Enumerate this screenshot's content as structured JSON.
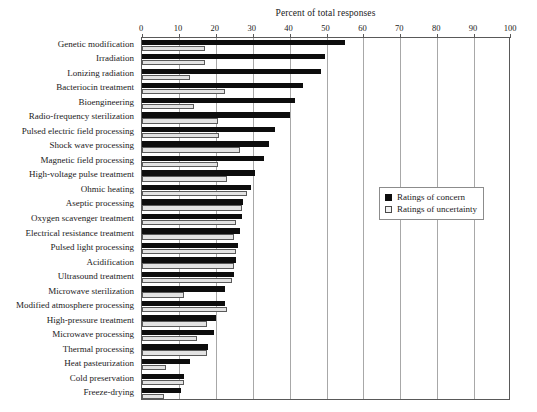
{
  "chart_data": {
    "type": "bar",
    "orientation": "horizontal",
    "title": "Percent of total responses",
    "xlabel": "Percent of total responses",
    "ylabel": "",
    "xlim": [
      0,
      100
    ],
    "xticks": [
      0,
      10,
      20,
      30,
      40,
      50,
      60,
      70,
      80,
      90,
      100
    ],
    "grid": true,
    "legend_position": "center-right",
    "categories": [
      "Genetic modification",
      "Irradiation",
      "Lonizing radiation",
      "Bacteriocin treatment",
      "Bioengineering",
      "Radio-frequency sterilization",
      "Pulsed electric field processing",
      "Shock wave processing",
      "Magnetic field processing",
      "High-voltage pulse treatment",
      "Ohmic heating",
      "Aseptic processing",
      "Oxygen scavenger treatment",
      "Electrical resistance treatment",
      "Pulsed light processing",
      "Acidification",
      "Ultrasound treatment",
      "Microwave sterilization",
      "Modified atmosphere processing",
      "High-pressure treatment",
      "Microwave processing",
      "Thermal processing",
      "Heat pasteurization",
      "Cold preservation",
      "Freeze-drying"
    ],
    "series": [
      {
        "name": "Ratings of concern",
        "color": "#0d0d0d",
        "values": [
          55.0,
          49.5,
          48.5,
          43.5,
          41.5,
          40.0,
          36.0,
          34.5,
          33.0,
          30.5,
          29.5,
          27.5,
          27.0,
          26.5,
          26.0,
          25.5,
          25.0,
          22.5,
          22.5,
          20.0,
          19.5,
          18.0,
          13.0,
          11.5,
          10.5
        ],
        "symbol": "filled-square"
      },
      {
        "name": "Ratings of uncertainty",
        "color": "#e3e3e3",
        "values": [
          17.0,
          17.0,
          13.0,
          22.5,
          14.0,
          20.5,
          21.0,
          26.5,
          20.5,
          23.0,
          28.5,
          27.0,
          25.5,
          25.0,
          25.5,
          25.0,
          24.5,
          11.5,
          23.0,
          17.5,
          15.0,
          17.5,
          6.5,
          11.5,
          6.0
        ],
        "symbol": "open-square"
      }
    ]
  },
  "legend": {
    "items": [
      {
        "label": "Ratings of concern"
      },
      {
        "label": "Ratings of uncertainty"
      }
    ]
  }
}
